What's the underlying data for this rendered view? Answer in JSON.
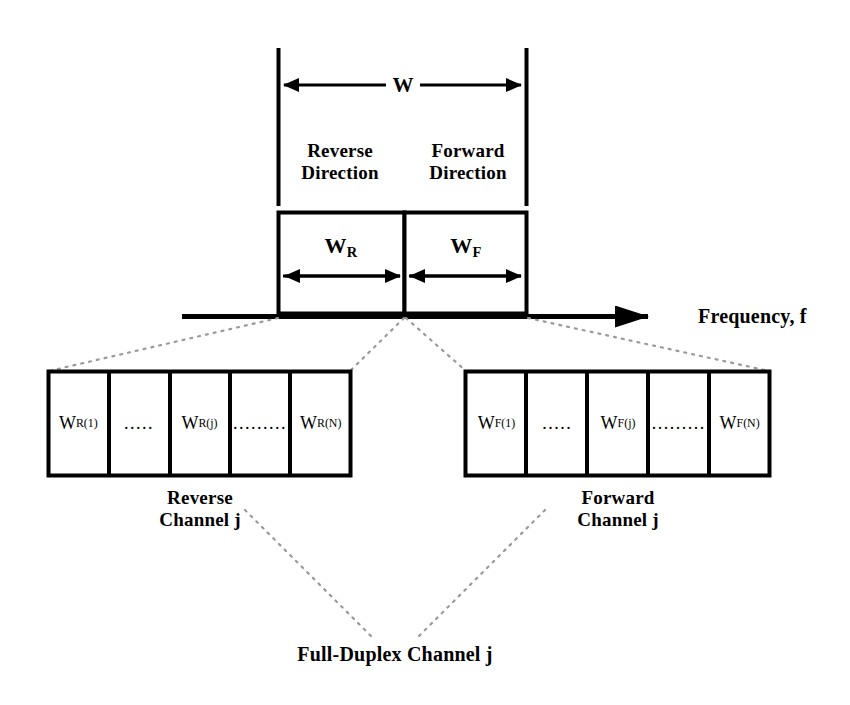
{
  "diagram": {
    "title_caption": "Full-Duplex Channel j",
    "spectrum": {
      "total_bandwidth_label": "W",
      "reverse_direction_label_line1": "Reverse",
      "reverse_direction_label_line2": "Direction",
      "forward_direction_label_line1": "Forward",
      "forward_direction_label_line2": "Direction",
      "reverse_bandwidth_label": "W",
      "reverse_bandwidth_sub": "R",
      "forward_bandwidth_label": "W",
      "forward_bandwidth_sub": "F"
    },
    "axis": {
      "label": "Frequency, f"
    },
    "reverse_channel": {
      "caption_line1": "Reverse",
      "caption_line2": "Channel j",
      "cells": [
        {
          "base": "W",
          "sub": "R",
          "sup": "(1)",
          "is_ellipsis": false,
          "text": ""
        },
        {
          "base": "",
          "sub": "",
          "sup": "",
          "is_ellipsis": true,
          "text": "....."
        },
        {
          "base": "W",
          "sub": "R",
          "sup": "(j)",
          "is_ellipsis": false,
          "text": ""
        },
        {
          "base": "",
          "sub": "",
          "sup": "",
          "is_ellipsis": true,
          "text": "........."
        },
        {
          "base": "W",
          "sub": "R",
          "sup": "(N)",
          "is_ellipsis": false,
          "text": ""
        }
      ]
    },
    "forward_channel": {
      "caption_line1": "Forward",
      "caption_line2": "Channel j",
      "cells": [
        {
          "base": "W",
          "sub": "F",
          "sup": "(1)",
          "is_ellipsis": false,
          "text": ""
        },
        {
          "base": "",
          "sub": "",
          "sup": "",
          "is_ellipsis": true,
          "text": "....."
        },
        {
          "base": "W",
          "sub": "F",
          "sup": "(j)",
          "is_ellipsis": false,
          "text": ""
        },
        {
          "base": "",
          "sub": "",
          "sup": "",
          "is_ellipsis": true,
          "text": "........."
        },
        {
          "base": "W",
          "sub": "F",
          "sup": "(N)",
          "is_ellipsis": false,
          "text": ""
        }
      ]
    },
    "colors": {
      "stroke": "#000000",
      "background": "#ffffff",
      "dotted": "#9a9a9a"
    }
  }
}
